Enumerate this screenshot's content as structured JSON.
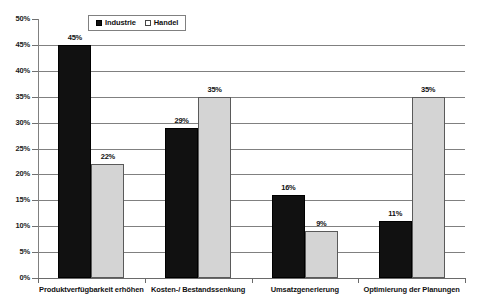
{
  "chart_data": {
    "type": "bar",
    "title": "",
    "subtitle": "",
    "xlabel": "",
    "ylabel": "",
    "grid": true,
    "legend_position": "top-center",
    "ylim": [
      0,
      50
    ],
    "ytick_labels": [
      "0%",
      "5%",
      "10%",
      "15%",
      "20%",
      "25%",
      "30%",
      "35%",
      "40%",
      "45%",
      "50%"
    ],
    "ytick_values": [
      0,
      5,
      10,
      15,
      20,
      25,
      30,
      35,
      40,
      45,
      50
    ],
    "categories": [
      "Produktverfügbarkeit erhöhen",
      "Kosten-/ Bestandssenkung",
      "Umsatzgenerierung",
      "Optimierung der Planungen"
    ],
    "series": [
      {
        "name": "Industrie",
        "color": "#111111",
        "values": [
          45,
          29,
          16,
          11
        ],
        "value_labels": [
          "45%",
          "29%",
          "16%",
          "11%"
        ]
      },
      {
        "name": "Handel",
        "color": "#d4d4d4",
        "values": [
          22,
          35,
          9,
          35
        ],
        "value_labels": [
          "22%",
          "35%",
          "9%",
          "35%"
        ]
      }
    ]
  },
  "legend": {
    "entries": [
      {
        "label": "Industrie",
        "swatch": "filled-black-square"
      },
      {
        "label": "Handel",
        "swatch": "open-white-square"
      }
    ]
  }
}
